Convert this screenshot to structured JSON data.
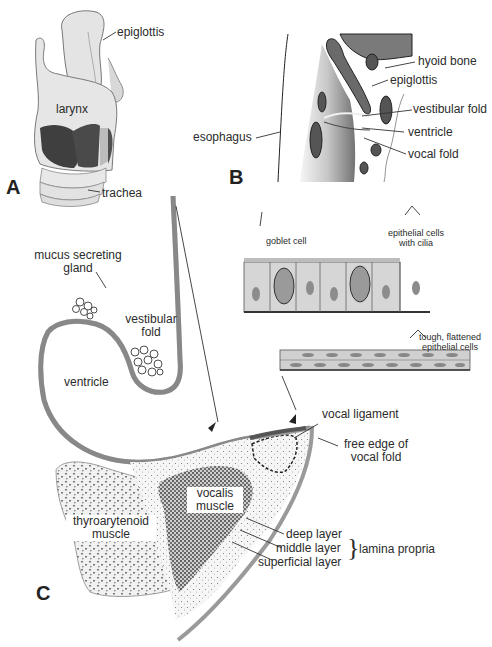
{
  "figure": {
    "panels": [
      {
        "id": "A",
        "label": "A"
      },
      {
        "id": "B",
        "label": "B"
      },
      {
        "id": "C",
        "label": "C"
      }
    ],
    "panel_a": {
      "labels": {
        "epiglottis": "epiglottis",
        "larynx": "larynx",
        "trachea": "trachea"
      }
    },
    "panel_b": {
      "labels": {
        "hyoid_bone": "hyoid bone",
        "epiglottis": "epiglottis",
        "vestibular_fold": "vestibular fold",
        "ventricle": "ventricle",
        "vocal_fold": "vocal fold",
        "esophagus": "esophagus"
      }
    },
    "panel_c": {
      "labels": {
        "mucus_gland_line1": "mucus secreting",
        "mucus_gland_line2": "gland",
        "vestibular_fold_line1": "vestibular",
        "vestibular_fold_line2": "fold",
        "ventricle": "ventricle",
        "goblet_cell": "goblet cell",
        "ciliated_line1": "epithelial cells",
        "ciliated_line2": "with cilia",
        "flattened_line1": "tough, flattened",
        "flattened_line2": "epithelial cells",
        "vocal_ligament": "vocal ligament",
        "free_edge_line1": "free edge of",
        "free_edge_line2": "vocal fold",
        "vocalis_line1": "vocalis",
        "vocalis_line2": "muscle",
        "thyro_line1": "thyroarytenoid",
        "thyro_line2": "muscle",
        "deep_layer": "deep layer",
        "middle_layer": "middle layer",
        "superficial_layer": "superficial layer",
        "lamina_propria": "lamina propria"
      }
    },
    "colors": {
      "mucosa_gray": "#9a9a9a",
      "dark_muscle": "#3c3c3c",
      "cartilage_light": "#e8e8e8",
      "cell_fill": "#d6d6d6",
      "nucleus": "#8c8c8c"
    }
  }
}
